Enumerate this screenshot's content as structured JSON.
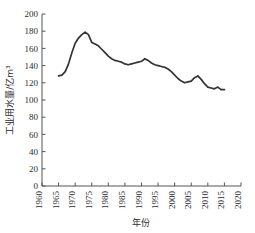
{
  "chart_data": {
    "type": "line",
    "title": "",
    "xlabel": "年份",
    "ylabel": "工业用水量/亿m³",
    "xlim": [
      1960,
      2020
    ],
    "ylim": [
      0,
      200
    ],
    "xticks": [
      1960,
      1965,
      1970,
      1975,
      1980,
      1985,
      1990,
      1995,
      2000,
      2005,
      2010,
      2015,
      2020
    ],
    "yticks": [
      0,
      20,
      40,
      60,
      80,
      100,
      120,
      140,
      160,
      180,
      200
    ],
    "grid": false,
    "legend": null,
    "line_color": "#333333",
    "series": [
      {
        "name": "工业用水量",
        "x": [
          1965,
          1966,
          1967,
          1968,
          1969,
          1970,
          1971,
          1972,
          1973,
          1974,
          1975,
          1976,
          1977,
          1978,
          1979,
          1980,
          1981,
          1982,
          1983,
          1984,
          1985,
          1986,
          1987,
          1988,
          1989,
          1990,
          1991,
          1992,
          1993,
          1994,
          1995,
          1996,
          1997,
          1998,
          1999,
          2000,
          2001,
          2002,
          2003,
          2004,
          2005,
          2006,
          2007,
          2008,
          2009,
          2010,
          2011,
          2012,
          2013,
          2014,
          2015
        ],
        "values": [
          128,
          129,
          133,
          142,
          155,
          166,
          172,
          176,
          179,
          176,
          167,
          165,
          163,
          159,
          155,
          151,
          148,
          146,
          145,
          144,
          142,
          141,
          142,
          143,
          144,
          145,
          148,
          146,
          143,
          141,
          140,
          139,
          138,
          136,
          133,
          129,
          125,
          122,
          120,
          121,
          122,
          126,
          128,
          124,
          119,
          115,
          114,
          113,
          115,
          112,
          112
        ]
      }
    ]
  },
  "ticklabels": {
    "y": [
      "200",
      "180",
      "160",
      "140",
      "120",
      "100",
      "80",
      "60",
      "40",
      "20",
      "0"
    ],
    "x": [
      "1960",
      "1965",
      "1970",
      "1975",
      "1980",
      "1985",
      "1990",
      "1995",
      "2000",
      "2005",
      "2010",
      "2015",
      "2020"
    ]
  },
  "axis_titles": {
    "x": "年份",
    "y": "工业用水量/亿m³"
  }
}
